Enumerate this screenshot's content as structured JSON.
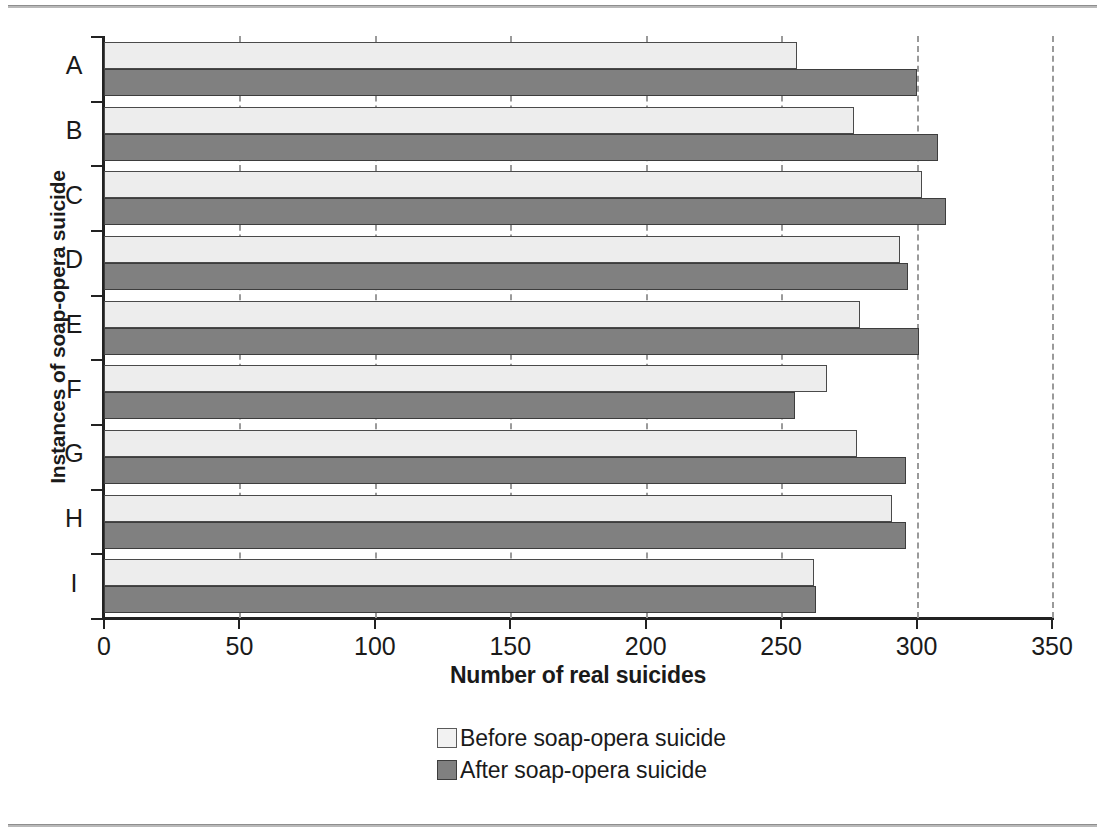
{
  "chart_data": {
    "type": "bar",
    "orientation": "horizontal",
    "title": "",
    "xlabel": "Number of real suicides",
    "ylabel": "Instances of soap-opera suicide",
    "categories": [
      "A",
      "B",
      "C",
      "D",
      "E",
      "F",
      "G",
      "H",
      "I"
    ],
    "series": [
      {
        "name": "Before soap-opera suicide",
        "color": "#ededed",
        "values": [
          256,
          277,
          302,
          294,
          279,
          267,
          278,
          291,
          262
        ]
      },
      {
        "name": "After soap-opera suicide",
        "color": "#808080",
        "values": [
          300,
          308,
          311,
          297,
          301,
          255,
          296,
          296,
          263
        ]
      }
    ],
    "xlim": [
      0,
      350
    ],
    "xticks": [
      0,
      50,
      100,
      150,
      200,
      250,
      300,
      350
    ],
    "xtick_labels": [
      "0",
      "50",
      "100",
      "150",
      "200",
      "250",
      "300",
      "350"
    ],
    "grid": "vertical-dashed",
    "legend_position": "bottom-center"
  },
  "legend": {
    "items": [
      {
        "label": "Before soap-opera suicide",
        "swatch": "before"
      },
      {
        "label": "After soap-opera suicide",
        "swatch": "after"
      }
    ]
  }
}
